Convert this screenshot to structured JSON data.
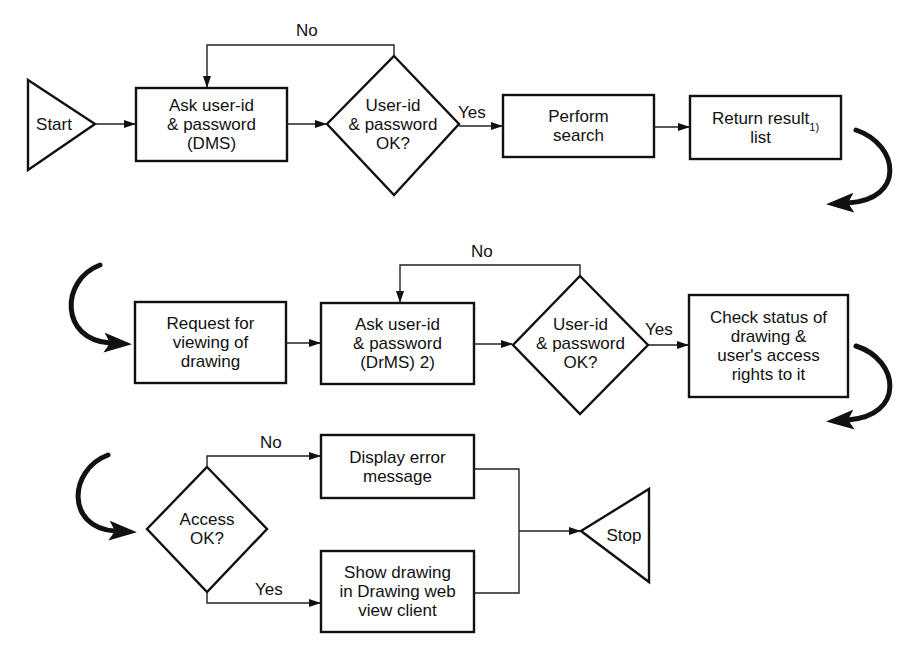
{
  "diagram": {
    "type": "flowchart",
    "nodes": {
      "start": {
        "label": "Start",
        "shape": "triangle"
      },
      "ask_dms": {
        "label": "Ask user-id\n& password\n(DMS)",
        "shape": "box"
      },
      "check_dms": {
        "label": "User-id\n& password\nOK?",
        "shape": "diamond"
      },
      "perform_search": {
        "label": "Perform\nsearch",
        "shape": "box"
      },
      "return_result": {
        "label": "Return result\nlist",
        "footnote": "1)",
        "shape": "box"
      },
      "request_view": {
        "label": "Request for\nviewing of\ndrawing",
        "shape": "box"
      },
      "ask_drms": {
        "label": "Ask user-id\n& password\n(DrMS) 2)",
        "shape": "box"
      },
      "check_drms": {
        "label": "User-id\n& password\nOK?",
        "shape": "diamond"
      },
      "check_status": {
        "label": "Check status of\ndrawing &\nuser's access\nrights to it",
        "shape": "box"
      },
      "access_ok": {
        "label": "Access\nOK?",
        "shape": "diamond"
      },
      "display_error": {
        "label": "Display error\nmessage",
        "shape": "box"
      },
      "show_drawing": {
        "label": "Show drawing\nin Drawing web\nview client",
        "shape": "box"
      },
      "stop": {
        "label": "Stop",
        "shape": "triangle"
      }
    },
    "edge_labels": {
      "dms_no": "No",
      "dms_yes": "Yes",
      "drms_no": "No",
      "drms_yes": "Yes",
      "access_no": "No",
      "access_yes": "Yes"
    },
    "edges": [
      {
        "from": "start",
        "to": "ask_dms"
      },
      {
        "from": "ask_dms",
        "to": "check_dms"
      },
      {
        "from": "check_dms",
        "to": "ask_dms",
        "label": "No"
      },
      {
        "from": "check_dms",
        "to": "perform_search",
        "label": "Yes"
      },
      {
        "from": "perform_search",
        "to": "return_result"
      },
      {
        "from": "return_result",
        "to": "request_view"
      },
      {
        "from": "request_view",
        "to": "ask_drms"
      },
      {
        "from": "ask_drms",
        "to": "check_drms"
      },
      {
        "from": "check_drms",
        "to": "ask_drms",
        "label": "No"
      },
      {
        "from": "check_drms",
        "to": "check_status",
        "label": "Yes"
      },
      {
        "from": "check_status",
        "to": "access_ok"
      },
      {
        "from": "access_ok",
        "to": "display_error",
        "label": "No"
      },
      {
        "from": "access_ok",
        "to": "show_drawing",
        "label": "Yes"
      },
      {
        "from": "display_error",
        "to": "stop"
      },
      {
        "from": "show_drawing",
        "to": "stop"
      }
    ]
  }
}
